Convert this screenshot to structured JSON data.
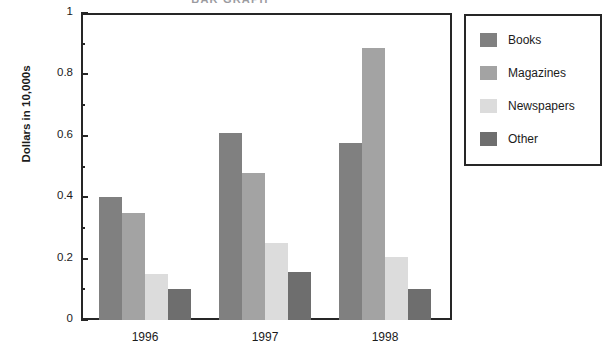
{
  "chart_data": {
    "type": "bar",
    "title": "BAR GRAPH",
    "xlabel": "",
    "ylabel": "Dollars in 10,000s",
    "categories": [
      "1996",
      "1997",
      "1998"
    ],
    "series": [
      {
        "name": "Books",
        "values": [
          0.4,
          0.61,
          0.575
        ],
        "color": "#808080"
      },
      {
        "name": "Magazines",
        "values": [
          0.35,
          0.48,
          0.885
        ],
        "color": "#a3a3a3"
      },
      {
        "name": "Newspapers",
        "values": [
          0.15,
          0.25,
          0.205
        ],
        "color": "#dcdcdc"
      },
      {
        "name": "Other",
        "values": [
          0.1,
          0.155,
          0.1
        ],
        "color": "#6e6e6e"
      }
    ],
    "ylim": [
      0,
      1
    ],
    "y_major_ticks": [
      "0",
      "0.2",
      "0.4",
      "0.6",
      "0.8",
      "1"
    ],
    "y_major_values": [
      0,
      0.2,
      0.4,
      0.6,
      0.8,
      1
    ],
    "y_minor_values": [
      0.1,
      0.3,
      0.5,
      0.7,
      0.9
    ],
    "grid": false,
    "legend_position": "right",
    "legend_entries": [
      "Books",
      "Magazines",
      "Newspapers",
      "Other"
    ]
  },
  "axis": {
    "frame_color": "#262626"
  }
}
